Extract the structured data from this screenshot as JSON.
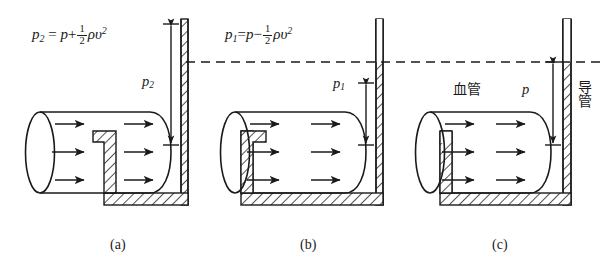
{
  "figure": {
    "title": "",
    "background": "#ffffff",
    "ink_color": "#1a1a1a",
    "panels": [
      {
        "id": "a",
        "caption": "(a)",
        "formula_text": "p2 = p + 1/2 ρυ²",
        "formula": {
          "lhs_symbol": "p",
          "lhs_sub": "2",
          "equals": "=",
          "term1": "p",
          "operator": "+",
          "frac_num": "1",
          "frac_den": "2",
          "rho": "ρ",
          "v": "υ",
          "v_exp": "2"
        },
        "height_label": "p",
        "height_label_sub": "2",
        "probe_orientation": "upstream-facing",
        "tube_style": "hatched-wall"
      },
      {
        "id": "b",
        "caption": "(b)",
        "formula_text": "p1 = p − 1/2 ρυ²",
        "formula": {
          "lhs_symbol": "p",
          "lhs_sub": "1",
          "equals": "=",
          "term1": "p",
          "operator": "−",
          "frac_num": "1",
          "frac_den": "2",
          "rho": "ρ",
          "v": "υ",
          "v_exp": "2"
        },
        "height_label": "p",
        "height_label_sub": "1",
        "probe_orientation": "downstream-facing",
        "tube_style": "hatched-wall"
      },
      {
        "id": "c",
        "caption": "(c)",
        "formula_text": "",
        "height_label": "p",
        "height_label_sub": "",
        "vessel_label": "血管",
        "catheter_label": "导管",
        "probe_orientation": "straight-open",
        "tube_style": "hatched-wall"
      }
    ],
    "reference_line": {
      "style": "dashed",
      "meaning": "common pressure reference level"
    },
    "flow_arrows_per_panel": 6,
    "flow_direction": "left-to-right"
  }
}
